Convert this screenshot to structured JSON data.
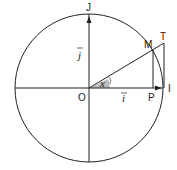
{
  "diagram": {
    "type": "trigonometric-unit-circle",
    "colors": {
      "stroke": "#222222",
      "angle_fill": "#bdbdbd",
      "background": "#ffffff"
    },
    "labels": {
      "origin": "O",
      "x_unit_point": "I",
      "y_unit_point": "J",
      "point_on_circle": "M",
      "projection": "P",
      "tangent_point": "T",
      "vector_i": "i",
      "vector_j": "j",
      "angle": "x"
    }
  }
}
